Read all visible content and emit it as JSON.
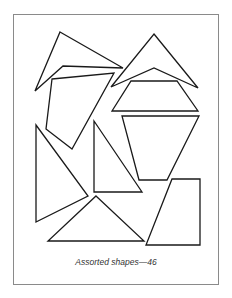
{
  "worksheet": {
    "caption": "Assorted shapes—46",
    "stroke_color": "#1a1a1a",
    "frame_color": "#8a8a8a",
    "shapes": [
      {
        "name": "kite-shape-top-left",
        "points": "60,32 123,68 63,66 35,91"
      },
      {
        "name": "quadrilateral-shape",
        "points": "52,79 114,73 72,149 46,129"
      },
      {
        "name": "arrowhead-shape-top-right",
        "points": "154,34 198,88 154,68 111,87"
      },
      {
        "name": "trapezoid-shape-middle-right",
        "points": "131,81 177,81 198,111 112,111"
      },
      {
        "name": "inverted-trapezoid-shape",
        "points": "122,116 199,116 167,180 139,180"
      },
      {
        "name": "triangle-shape-left",
        "points": "36,125 88,196 36,222"
      },
      {
        "name": "right-triangle-shape-middle",
        "points": "94,121 142,192 94,192"
      },
      {
        "name": "triangle-shape-bottom",
        "points": "96,196 144,241 48,241"
      },
      {
        "name": "trapezoid-shape-bottom-right",
        "points": "172,179 200,179 200,245 146,245"
      }
    ]
  }
}
